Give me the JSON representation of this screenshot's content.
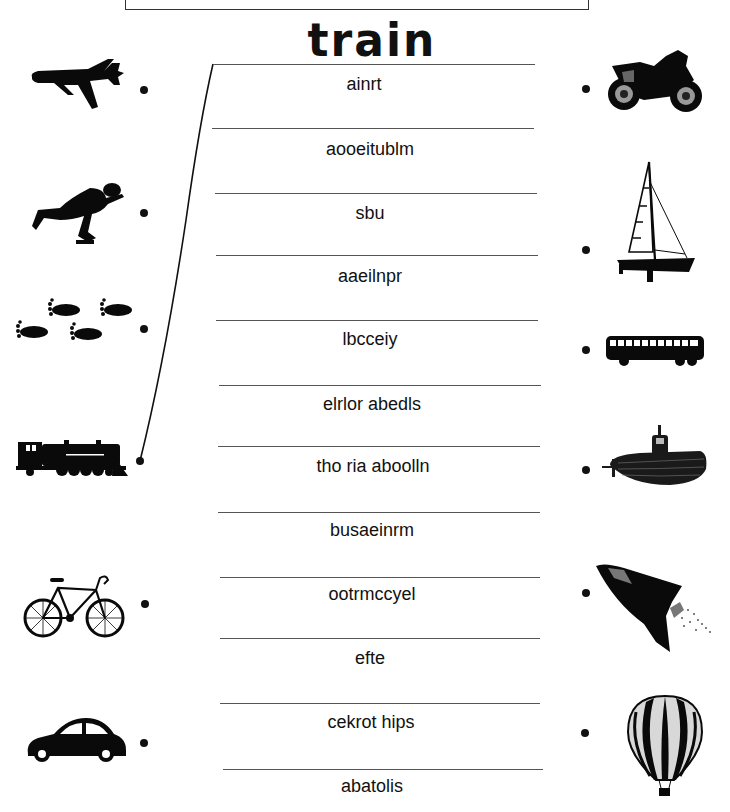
{
  "worksheet": {
    "written_answer": "train",
    "scrambled_words": [
      "ainrt",
      "aooeitublm",
      "sbu",
      "aaeilnpr",
      "lbcceiy",
      "elrlor  abedls",
      "tho ria aboolln",
      "busaeinrm",
      "ootrmccyel",
      "efte",
      "cekrot  hips",
      "abatolis"
    ],
    "left_pictures": [
      {
        "icon": "airplane-icon"
      },
      {
        "icon": "roller-skater-icon"
      },
      {
        "icon": "footprints-icon"
      },
      {
        "icon": "steam-train-icon"
      },
      {
        "icon": "bicycle-icon"
      },
      {
        "icon": "car-icon"
      }
    ],
    "right_pictures": [
      {
        "icon": "motorcycle-icon"
      },
      {
        "icon": "sailboat-icon"
      },
      {
        "icon": "bus-icon"
      },
      {
        "icon": "submarine-icon"
      },
      {
        "icon": "space-shuttle-icon"
      },
      {
        "icon": "hot-air-balloon-icon"
      }
    ],
    "drawn_connection": {
      "from": "steam-train-icon",
      "to_line": 1
    }
  }
}
